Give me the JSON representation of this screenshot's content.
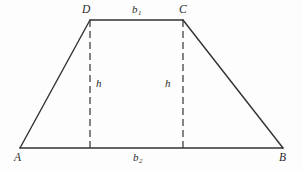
{
  "figure": {
    "kind": "trapezoid-diagram",
    "background_color": "#fdfdfd",
    "stroke_color": "#333333",
    "solid_stroke_width": 1.4,
    "dashed_stroke_width": 1.2,
    "dash_pattern": "7 4"
  },
  "vertices": [
    {
      "name": "A",
      "label": "A",
      "x": 20,
      "y": 148
    },
    {
      "name": "B",
      "label": "B",
      "x": 283,
      "y": 148
    },
    {
      "name": "C",
      "label": "C",
      "x": 183,
      "y": 20
    },
    {
      "name": "D",
      "label": "D",
      "x": 90,
      "y": 20
    }
  ],
  "edges": [
    {
      "name": "side-AD",
      "from": "A",
      "to": "D",
      "style": "solid"
    },
    {
      "name": "top-DC",
      "from": "D",
      "to": "C",
      "style": "solid"
    },
    {
      "name": "side-CB",
      "from": "C",
      "to": "B",
      "style": "solid"
    },
    {
      "name": "base-AB",
      "from": "A",
      "to": "B",
      "style": "solid"
    }
  ],
  "height_lines": [
    {
      "name": "height-left",
      "x": 90,
      "y_top": 20,
      "y_bottom": 148,
      "style": "dashed"
    },
    {
      "name": "height-right",
      "x": 183,
      "y_top": 20,
      "y_bottom": 148,
      "style": "dashed"
    }
  ],
  "labels": {
    "vertex_a": "A",
    "vertex_b": "B",
    "vertex_c": "C",
    "vertex_d": "D",
    "top_base": "b",
    "top_base_subscript": "1",
    "bottom_base": "b",
    "bottom_base_subscript": "2",
    "height_left": "h",
    "height_right": "h"
  }
}
